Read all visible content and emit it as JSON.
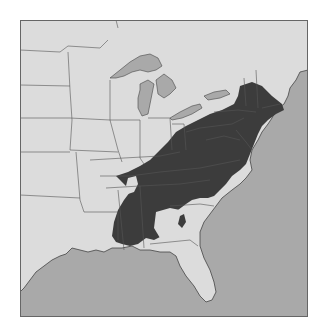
{
  "map": {
    "region": "Eastern United States",
    "description": "Range/distribution map with shaded area covering Appalachian region and New England",
    "colors": {
      "land": "#dcdcdc",
      "water": "#a9a9a9",
      "range": "#3c3c3c",
      "border": "#555555",
      "background": "#ffffff"
    },
    "legend": null
  }
}
